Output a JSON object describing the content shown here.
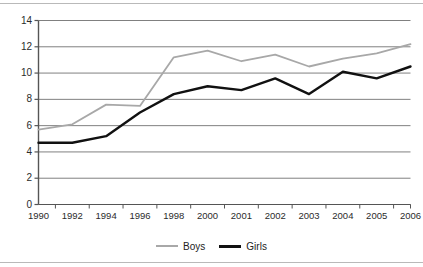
{
  "chart_data": {
    "type": "line",
    "title": "",
    "subtitle": "",
    "xlabel": "",
    "ylabel": "",
    "categories": [
      "1990",
      "1992",
      "1994",
      "1996",
      "1998",
      "2000",
      "2001",
      "2002",
      "2003",
      "2004",
      "2005",
      "2006"
    ],
    "ylim": [
      0,
      14
    ],
    "ytick_labels": [
      "0",
      "2",
      "4",
      "6",
      "8",
      "10",
      "12",
      "14"
    ],
    "ytick_values": [
      0,
      2,
      4,
      6,
      8,
      10,
      12,
      14
    ],
    "grid": true,
    "legend_position": "bottom-center",
    "series": [
      {
        "name": "Boys",
        "color": "#a8a8a8",
        "values": [
          5.7,
          6.1,
          7.6,
          7.5,
          11.2,
          11.7,
          10.9,
          11.4,
          10.5,
          11.1,
          11.5,
          12.2
        ]
      },
      {
        "name": "Girls",
        "color": "#111111",
        "values": [
          4.7,
          4.7,
          5.2,
          7.0,
          8.4,
          9.0,
          8.7,
          9.6,
          8.4,
          10.1,
          9.6,
          10.5
        ]
      }
    ]
  },
  "legend": {
    "entries": [
      {
        "label": "Boys",
        "color": "#a8a8a8"
      },
      {
        "label": "Girls",
        "color": "#111111"
      }
    ]
  },
  "axes": {
    "y_labels": [
      "14",
      "12",
      "10",
      "8",
      "6",
      "4",
      "2",
      "0"
    ],
    "x_labels": [
      "1990",
      "1992",
      "1994",
      "1996",
      "1998",
      "2000",
      "2001",
      "2002",
      "2003",
      "2004",
      "2005",
      "2006"
    ]
  }
}
